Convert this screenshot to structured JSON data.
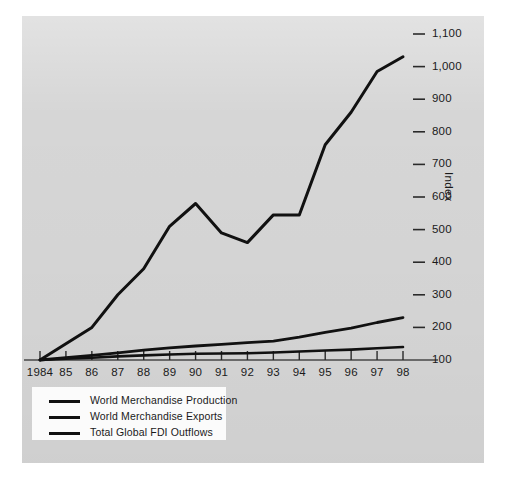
{
  "figure": {
    "panel_color": "#d6d6d6",
    "line_color": "#111111",
    "axis_label": "Index"
  },
  "legend": {
    "items": [
      {
        "label": "World Merchandise Production"
      },
      {
        "label": "World Merchandise Exports"
      },
      {
        "label": "Total Global FDI Outflows"
      }
    ]
  },
  "chart_data": {
    "type": "line",
    "title": "",
    "subtitle": "",
    "xlabel": "",
    "ylabel": "Index",
    "ylim": [
      100,
      1100
    ],
    "yticks": [
      100,
      200,
      300,
      400,
      500,
      600,
      700,
      800,
      900,
      1000,
      1100
    ],
    "ytick_labels": [
      "100",
      "200",
      "300",
      "400",
      "500",
      "600",
      "700",
      "800",
      "900",
      "1,000",
      "1,100"
    ],
    "grid": false,
    "legend_position": "bottom-left",
    "x": [
      1984,
      1985,
      1986,
      1987,
      1988,
      1989,
      1990,
      1991,
      1992,
      1993,
      1994,
      1995,
      1996,
      1997,
      1998
    ],
    "xtick_labels": [
      "1984",
      "85",
      "86",
      "87",
      "88",
      "89",
      "90",
      "91",
      "92",
      "93",
      "94",
      "95",
      "96",
      "97",
      "98"
    ],
    "series": [
      {
        "name": "Total Global FDI Outflows",
        "values": [
          100,
          150,
          200,
          300,
          380,
          510,
          580,
          490,
          460,
          545,
          545,
          760,
          860,
          985,
          1030
        ]
      },
      {
        "name": "World Merchandise Exports",
        "values": [
          100,
          107,
          114,
          122,
          130,
          137,
          143,
          148,
          153,
          158,
          170,
          185,
          198,
          215,
          230
        ]
      },
      {
        "name": "World Merchandise Production",
        "values": [
          100,
          104,
          107,
          111,
          114,
          117,
          119,
          120,
          121,
          123,
          126,
          129,
          132,
          136,
          140
        ]
      }
    ]
  }
}
